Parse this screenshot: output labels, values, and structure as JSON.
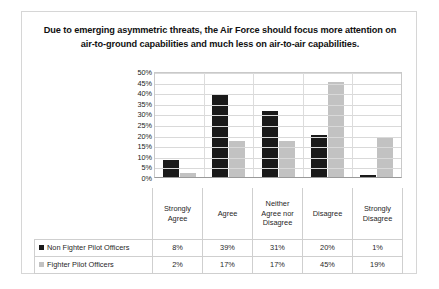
{
  "chart_data": {
    "type": "bar",
    "title": "Due to emerging asymmetric threats, the Air Force should focus more attention on air-to-ground capabilities and much less on air-to-air capabilities.",
    "xlabel": "",
    "ylabel": "",
    "ylim": [
      0,
      50
    ],
    "ytick_labels": [
      "50%",
      "45%",
      "40%",
      "35%",
      "30%",
      "25%",
      "20%",
      "15%",
      "10%",
      "5%",
      "0%"
    ],
    "ytick_values": [
      50,
      45,
      40,
      35,
      30,
      25,
      20,
      15,
      10,
      5,
      0
    ],
    "grid": true,
    "legend_position": "bottom-table",
    "categories": [
      "Strongly Agree",
      "Agree",
      "Neither Agree nor Disagree",
      "Disagree",
      "Strongly Disagree"
    ],
    "series": [
      {
        "name": "Non Fighter Pilot Officers",
        "color": "#1a1a1a",
        "values": [
          8,
          39,
          31,
          20,
          1
        ],
        "labels": [
          "8%",
          "39%",
          "31%",
          "20%",
          "1%"
        ]
      },
      {
        "name": "Fighter Pilot Officers",
        "color": "#c2c2c2",
        "values": [
          2,
          17,
          17,
          45,
          19
        ],
        "labels": [
          "2%",
          "17%",
          "17%",
          "45%",
          "19%"
        ]
      }
    ]
  }
}
